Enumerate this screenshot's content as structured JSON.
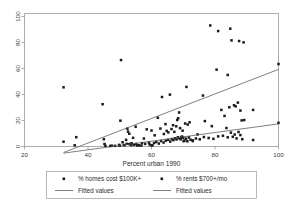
{
  "chart_data": {
    "type": "scatter",
    "title": "",
    "xlabel": "Percent urban 1990",
    "ylabel": "",
    "xlim": [
      20,
      100
    ],
    "ylim": [
      0,
      100
    ],
    "xticks": [
      20,
      40,
      60,
      80,
      100
    ],
    "yticks": [
      0,
      20,
      40,
      60,
      80,
      100
    ],
    "xtick_labels": [
      "20",
      "40",
      "60",
      "80",
      "100"
    ],
    "ytick_labels": [
      "0",
      "20",
      "40",
      "60",
      "80",
      "100"
    ],
    "grid": false,
    "legend_position": "below",
    "marker_color": "#1a1a1a",
    "line_color": "#555555",
    "series": [
      {
        "name": "% homes cost $100K+",
        "type": "scatter",
        "marker": "square",
        "points": [
          [
            32.3,
            44.5
          ],
          [
            32.3,
            3.6
          ],
          [
            35.8,
            0.9
          ],
          [
            36.3,
            7.0
          ],
          [
            44.6,
            31.8
          ],
          [
            45.2,
            1.9
          ],
          [
            45.0,
            5.5
          ],
          [
            47.5,
            0.6
          ],
          [
            49.8,
            1.2
          ],
          [
            50.2,
            19.4
          ],
          [
            50.4,
            65.0
          ],
          [
            50.9,
            3.2
          ],
          [
            51.3,
            1.1
          ],
          [
            52.0,
            5.0
          ],
          [
            52.4,
            13.4
          ],
          [
            52.6,
            11.2
          ],
          [
            53.0,
            9.6
          ],
          [
            53.4,
            2.0
          ],
          [
            53.6,
            1.0
          ],
          [
            54.2,
            6.5
          ],
          [
            55.0,
            14.9
          ],
          [
            55.5,
            0.8
          ],
          [
            56.8,
            0.7
          ],
          [
            57.6,
            6.0
          ],
          [
            58.5,
            12.9
          ],
          [
            59.4,
            1.5
          ],
          [
            60.0,
            12.0
          ],
          [
            60.3,
            0.9
          ],
          [
            61.0,
            8.4
          ],
          [
            62.0,
            21.6
          ],
          [
            62.8,
            13.5
          ],
          [
            63.3,
            37.2
          ],
          [
            63.9,
            9.4
          ],
          [
            64.4,
            16.8
          ],
          [
            64.8,
            11.7
          ],
          [
            65.3,
            10.6
          ],
          [
            65.8,
            39.0
          ],
          [
            66.3,
            13.1
          ],
          [
            66.8,
            16.0
          ],
          [
            67.2,
            11.0
          ],
          [
            67.8,
            15.2
          ],
          [
            68.1,
            19.9
          ],
          [
            68.4,
            21.2
          ],
          [
            68.7,
            25.6
          ],
          [
            69.0,
            13.8
          ],
          [
            69.4,
            7.0
          ],
          [
            69.8,
            11.9
          ],
          [
            70.1,
            4.0
          ],
          [
            70.6,
            17.3
          ],
          [
            71.0,
            44.8
          ],
          [
            71.4,
            16.5
          ],
          [
            72.0,
            18.2
          ],
          [
            73.0,
            4.1
          ],
          [
            74.5,
            9.1
          ],
          [
            76.2,
            38.3
          ],
          [
            76.8,
            19.1
          ],
          [
            78.5,
            91.0
          ],
          [
            79.0,
            15.3
          ],
          [
            80.5,
            57.8
          ],
          [
            81.0,
            86.8
          ],
          [
            82.0,
            27.5
          ],
          [
            83.0,
            23.0
          ],
          [
            83.6,
            13.9
          ],
          [
            84.0,
            53.8
          ],
          [
            84.5,
            29.5
          ],
          [
            84.8,
            88.6
          ],
          [
            85.2,
            79.8
          ],
          [
            86.0,
            31.0
          ],
          [
            86.5,
            30.2
          ],
          [
            87.2,
            33.0
          ],
          [
            87.6,
            79.3
          ],
          [
            88.0,
            27.0
          ],
          [
            88.4,
            19.6
          ],
          [
            89.0,
            78.3
          ],
          [
            92.0,
            27.5
          ],
          [
            100.0,
            62.0
          ]
        ]
      },
      {
        "name": "% rents $700+/mo",
        "type": "scatter",
        "marker": "square",
        "points": [
          [
            45.5,
            0.5
          ],
          [
            47.0,
            0.4
          ],
          [
            48.5,
            0.5
          ],
          [
            50.0,
            0.6
          ],
          [
            51.5,
            1.0
          ],
          [
            52.2,
            2.0
          ],
          [
            53.0,
            1.8
          ],
          [
            53.8,
            2.4
          ],
          [
            54.5,
            1.2
          ],
          [
            55.2,
            1.9
          ],
          [
            56.0,
            0.9
          ],
          [
            57.0,
            2.5
          ],
          [
            58.0,
            2.0
          ],
          [
            59.2,
            3.0
          ],
          [
            60.0,
            0.8
          ],
          [
            60.8,
            2.6
          ],
          [
            61.5,
            3.4
          ],
          [
            62.3,
            2.2
          ],
          [
            63.0,
            4.1
          ],
          [
            63.8,
            3.0
          ],
          [
            64.5,
            4.4
          ],
          [
            65.2,
            5.0
          ],
          [
            65.9,
            3.7
          ],
          [
            66.4,
            5.6
          ],
          [
            66.9,
            4.8
          ],
          [
            67.4,
            6.2
          ],
          [
            67.9,
            5.3
          ],
          [
            68.3,
            7.0
          ],
          [
            68.8,
            6.1
          ],
          [
            69.2,
            5.4
          ],
          [
            69.6,
            7.5
          ],
          [
            70.0,
            6.6
          ],
          [
            70.4,
            4.5
          ],
          [
            70.9,
            5.9
          ],
          [
            71.3,
            3.9
          ],
          [
            71.8,
            6.8
          ],
          [
            72.3,
            5.1
          ],
          [
            73.0,
            4.6
          ],
          [
            74.0,
            6.0
          ],
          [
            75.2,
            5.4
          ],
          [
            76.5,
            7.1
          ],
          [
            78.0,
            6.4
          ],
          [
            79.5,
            5.8
          ],
          [
            81.0,
            7.6
          ],
          [
            82.5,
            8.1
          ],
          [
            84.0,
            6.9
          ],
          [
            85.0,
            10.4
          ],
          [
            85.6,
            7.3
          ],
          [
            86.2,
            9.0
          ],
          [
            86.8,
            6.1
          ],
          [
            87.4,
            10.9
          ],
          [
            88.0,
            8.6
          ],
          [
            88.6,
            5.5
          ],
          [
            89.2,
            19.9
          ],
          [
            92.0,
            4.9
          ],
          [
            100.0,
            17.8
          ]
        ]
      }
    ],
    "fitted_lines": [
      {
        "name": "Fitted values",
        "series_ref": "% homes cost $100K+",
        "x": [
          32.3,
          100.0
        ],
        "y": [
          -4.5,
          58.0
        ]
      },
      {
        "name": "Fitted values",
        "series_ref": "% rents $700+/mo",
        "x": [
          32.3,
          100.0
        ],
        "y": [
          -5.0,
          17.0
        ]
      }
    ],
    "legend_entries": [
      {
        "label": "% homes cost $100K+",
        "glyph": "square-marker"
      },
      {
        "label": "% rents $700+/mo",
        "glyph": "square-marker"
      },
      {
        "label": "Fitted values",
        "glyph": "line-swatch"
      },
      {
        "label": "Fitted values",
        "glyph": "line-swatch"
      }
    ]
  }
}
